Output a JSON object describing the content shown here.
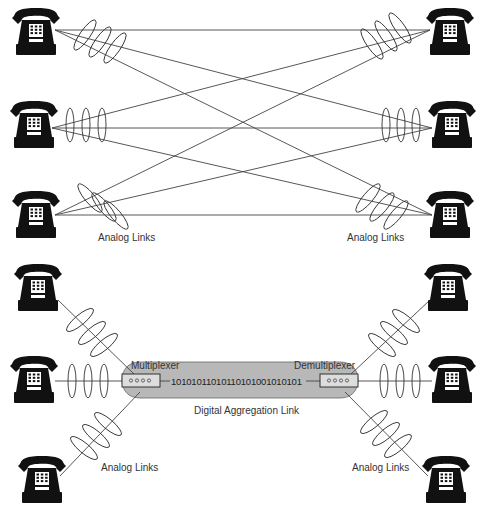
{
  "diagram": {
    "top_section": {
      "description": "Full mesh of analog links between telephones",
      "left_phones": 3,
      "right_phones": 3,
      "labels": {
        "left_analog": "Analog Links",
        "right_analog": "Analog Links"
      }
    },
    "bottom_section": {
      "description": "Telephones multiplexed over one digital link",
      "left_phones": 3,
      "right_phones": 3,
      "labels": {
        "multiplexer": "Multiplexer",
        "demultiplexer": "Demultiplexer",
        "bit_stream": "10101011010110101001010101",
        "digital_link": "Digital Aggregation Link",
        "left_analog": "Analog Links",
        "right_analog": "Analog Links"
      }
    },
    "colors": {
      "line": "#444444",
      "tube_fill": "#b8b8b8",
      "phone": "#111111",
      "text": "#333333"
    },
    "icons": {
      "phone": "telephone-icon",
      "mux": "multiplexer-device-icon",
      "demux": "demultiplexer-device-icon"
    }
  }
}
